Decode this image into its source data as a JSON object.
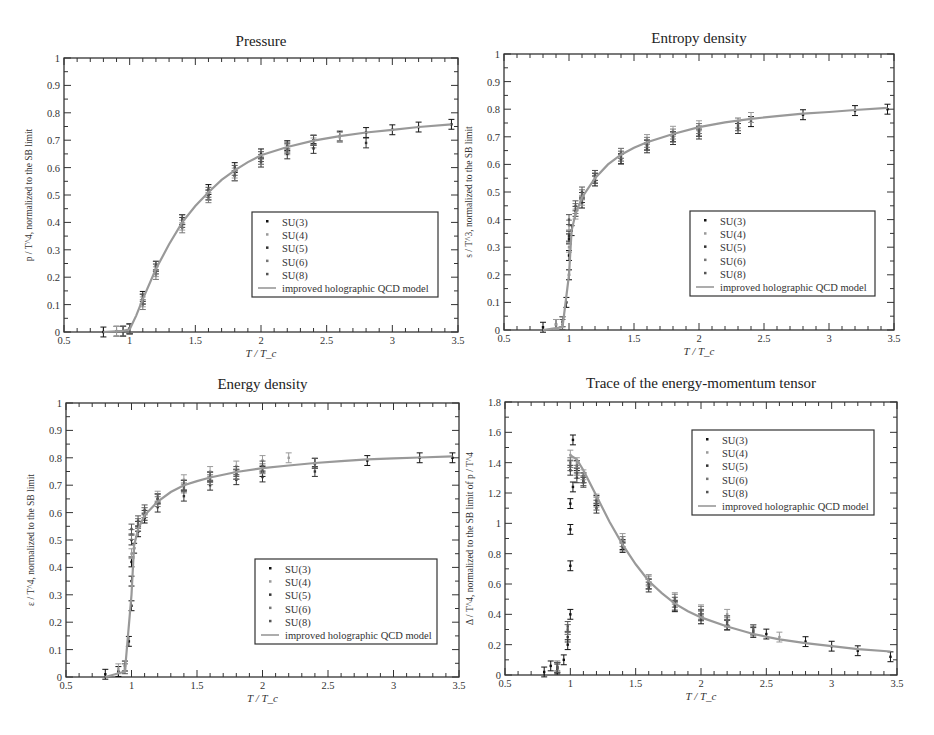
{
  "figure": {
    "background": "#ffffff",
    "legend_labels": [
      "SU(3)",
      "SU(4)",
      "SU(5)",
      "SU(6)",
      "SU(8)",
      "improved holographic QCD model"
    ],
    "series_colors": {
      "SU(3)": "#111111",
      "SU(4)": "#9a9a9a",
      "SU(5)": "#333333",
      "SU(6)": "#777777",
      "SU(8)": "#555555",
      "model": "#999999"
    }
  },
  "panels": [
    {
      "id": "pressure",
      "title": "Pressure",
      "xlabel": "T / T_c",
      "ylabel": "p / T^4, normalized to the SB limit",
      "xlim": [
        0.5,
        3.5
      ],
      "ylim": [
        0,
        1
      ],
      "xticks": [
        "0.5",
        "1",
        "1.5",
        "2",
        "2.5",
        "3",
        "3.5"
      ],
      "yticks": [
        "0",
        "0.1",
        "0.2",
        "0.3",
        "0.4",
        "0.5",
        "0.6",
        "0.7",
        "0.8",
        "0.9",
        "1"
      ],
      "legend_position": "lower right"
    },
    {
      "id": "entropy",
      "title": "Entropy density",
      "xlabel": "T / T_c",
      "ylabel": "s / T^3, normalized to the SB limit",
      "xlim": [
        0.5,
        3.5
      ],
      "ylim": [
        0,
        1
      ],
      "xticks": [
        "0.5",
        "1",
        "1.5",
        "2",
        "2.5",
        "3",
        "3.5"
      ],
      "yticks": [
        "0",
        "0.1",
        "0.2",
        "0.3",
        "0.4",
        "0.5",
        "0.6",
        "0.7",
        "0.8",
        "0.9",
        "1"
      ],
      "legend_position": "lower right"
    },
    {
      "id": "energy",
      "title": "Energy density",
      "xlabel": "T / T_c",
      "ylabel": "ε / T^4, normalized to the SB limit",
      "xlim": [
        0.5,
        3.5
      ],
      "ylim": [
        0,
        1
      ],
      "xticks": [
        "0.5",
        "1",
        "1.5",
        "2",
        "2.5",
        "3",
        "3.5"
      ],
      "yticks": [
        "0",
        "0.1",
        "0.2",
        "0.3",
        "0.4",
        "0.5",
        "0.6",
        "0.7",
        "0.8",
        "0.9",
        "1"
      ],
      "legend_position": "lower right"
    },
    {
      "id": "trace",
      "title": "Trace of the energy-momentum tensor",
      "xlabel": "T / T_c",
      "ylabel": "Δ / T^4, normalized to the SB limit of p / T^4",
      "xlim": [
        0.5,
        3.5
      ],
      "ylim": [
        0,
        1.8
      ],
      "xticks": [
        "0.5",
        "1",
        "1.5",
        "2",
        "2.5",
        "3",
        "3.5"
      ],
      "yticks": [
        "0",
        "0.2",
        "0.4",
        "0.6",
        "0.8",
        "1",
        "1.2",
        "1.4",
        "1.6",
        "1.8"
      ],
      "legend_position": "upper right"
    }
  ],
  "chart_data": [
    {
      "type": "scatter",
      "title": "Pressure",
      "xlabel": "T/T_c",
      "ylabel": "p/T^4, normalized to the SB limit",
      "xlim": [
        0.5,
        3.5
      ],
      "ylim": [
        0,
        1
      ],
      "grid": false,
      "legend": [
        "SU(3)",
        "SU(4)",
        "SU(5)",
        "SU(6)",
        "SU(8)",
        "improved holographic QCD model"
      ],
      "legend_position": "lower right",
      "model_curve": {
        "x": [
          0.8,
          0.95,
          1.0,
          1.05,
          1.1,
          1.2,
          1.3,
          1.4,
          1.5,
          1.6,
          1.7,
          1.8,
          1.9,
          2.0,
          2.2,
          2.4,
          2.6,
          2.8,
          3.0,
          3.2,
          3.45
        ],
        "y": [
          0.0,
          0.004,
          0.01,
          0.06,
          0.12,
          0.23,
          0.32,
          0.4,
          0.46,
          0.51,
          0.555,
          0.59,
          0.62,
          0.645,
          0.675,
          0.698,
          0.715,
          0.728,
          0.738,
          0.748,
          0.758
        ]
      },
      "series": [
        {
          "name": "SU(3)",
          "x": [
            0.8,
            0.9,
            1.0,
            1.1,
            1.2,
            1.4,
            1.6,
            1.8,
            2.0,
            2.2,
            2.4,
            2.6,
            2.8,
            3.0,
            3.2,
            3.45
          ],
          "y": [
            0.0,
            0.003,
            0.012,
            0.13,
            0.24,
            0.41,
            0.52,
            0.6,
            0.65,
            0.68,
            0.7,
            0.715,
            0.728,
            0.738,
            0.748,
            0.758
          ]
        },
        {
          "name": "SU(4)",
          "x": [
            0.9,
            1.0,
            1.1,
            1.2,
            1.4,
            1.6,
            1.8,
            2.0,
            2.2,
            2.4,
            2.6
          ],
          "y": [
            0.002,
            0.01,
            0.11,
            0.22,
            0.39,
            0.5,
            0.58,
            0.63,
            0.665,
            0.69,
            0.71
          ]
        },
        {
          "name": "SU(5)",
          "x": [
            0.95,
            1.0,
            1.1,
            1.2,
            1.4,
            1.6,
            1.8,
            2.0,
            2.2,
            2.4,
            2.8
          ],
          "y": [
            0.003,
            0.012,
            0.12,
            0.23,
            0.4,
            0.5,
            0.57,
            0.62,
            0.65,
            0.67,
            0.69
          ]
        },
        {
          "name": "SU(6)",
          "x": [
            0.95,
            1.0,
            1.1,
            1.2,
            1.4,
            1.6,
            1.8,
            2.0,
            2.2,
            2.4
          ],
          "y": [
            0.003,
            0.01,
            0.1,
            0.21,
            0.38,
            0.49,
            0.57,
            0.63,
            0.67,
            0.7
          ]
        },
        {
          "name": "SU(8)",
          "x": [
            0.95,
            1.0,
            1.1,
            1.2,
            1.4,
            1.6,
            1.8,
            2.0,
            2.2,
            2.4
          ],
          "y": [
            0.003,
            0.012,
            0.12,
            0.24,
            0.41,
            0.51,
            0.59,
            0.64,
            0.675,
            0.7
          ]
        }
      ]
    },
    {
      "type": "scatter",
      "title": "Entropy density",
      "xlabel": "T/T_c",
      "ylabel": "s/T^3, normalized to the SB limit",
      "xlim": [
        0.5,
        3.5
      ],
      "ylim": [
        0,
        1
      ],
      "grid": false,
      "legend": [
        "SU(3)",
        "SU(4)",
        "SU(5)",
        "SU(6)",
        "SU(8)",
        "improved holographic QCD model"
      ],
      "legend_position": "lower right",
      "model_curve": {
        "x": [
          0.8,
          0.95,
          1.0,
          1.02,
          1.05,
          1.1,
          1.2,
          1.3,
          1.4,
          1.5,
          1.6,
          1.8,
          2.0,
          2.2,
          2.4,
          2.6,
          2.8,
          3.0,
          3.2,
          3.45
        ],
        "y": [
          0.0,
          0.01,
          0.2,
          0.36,
          0.42,
          0.48,
          0.55,
          0.6,
          0.635,
          0.66,
          0.68,
          0.71,
          0.735,
          0.752,
          0.765,
          0.775,
          0.784,
          0.79,
          0.797,
          0.805
        ]
      },
      "series": [
        {
          "name": "SU(3)",
          "x": [
            0.8,
            0.9,
            0.98,
            1.0,
            1.0,
            1.0,
            1.02,
            1.1,
            1.2,
            1.4,
            1.6,
            1.8,
            2.0,
            2.4,
            2.8,
            3.2,
            3.45
          ],
          "y": [
            0.01,
            0.02,
            0.1,
            0.2,
            0.27,
            0.33,
            0.36,
            0.46,
            0.54,
            0.62,
            0.67,
            0.7,
            0.72,
            0.755,
            0.78,
            0.795,
            0.8
          ]
        },
        {
          "name": "SU(4)",
          "x": [
            0.9,
            1.0,
            1.05,
            1.1,
            1.2,
            1.4,
            1.6,
            1.8,
            2.0,
            2.4
          ],
          "y": [
            0.02,
            0.3,
            0.42,
            0.47,
            0.55,
            0.64,
            0.69,
            0.72,
            0.74,
            0.77
          ]
        },
        {
          "name": "SU(5)",
          "x": [
            0.95,
            1.0,
            1.05,
            1.1,
            1.2,
            1.4,
            1.6,
            1.8,
            2.0,
            2.3
          ],
          "y": [
            0.03,
            0.34,
            0.43,
            0.48,
            0.55,
            0.62,
            0.66,
            0.69,
            0.71,
            0.73
          ]
        },
        {
          "name": "SU(6)",
          "x": [
            0.95,
            1.0,
            1.05,
            1.1,
            1.2,
            1.4,
            1.6,
            1.8,
            2.0,
            2.3
          ],
          "y": [
            0.03,
            0.38,
            0.44,
            0.49,
            0.56,
            0.64,
            0.68,
            0.71,
            0.73,
            0.75
          ]
        },
        {
          "name": "SU(8)",
          "x": [
            0.95,
            1.0,
            1.05,
            1.1,
            1.2,
            1.4,
            1.6,
            1.8,
            2.0,
            2.3
          ],
          "y": [
            0.02,
            0.4,
            0.45,
            0.5,
            0.56,
            0.63,
            0.67,
            0.7,
            0.72,
            0.74
          ]
        }
      ]
    },
    {
      "type": "scatter",
      "title": "Energy density",
      "xlabel": "T/T_c",
      "ylabel": "ε/T^4, normalized to the SB limit",
      "xlim": [
        0.5,
        3.5
      ],
      "ylim": [
        0,
        1
      ],
      "grid": false,
      "legend": [
        "SU(3)",
        "SU(4)",
        "SU(5)",
        "SU(6)",
        "SU(8)",
        "improved holographic QCD model"
      ],
      "legend_position": "lower right",
      "model_curve": {
        "x": [
          0.8,
          0.95,
          1.0,
          1.02,
          1.05,
          1.1,
          1.2,
          1.3,
          1.4,
          1.5,
          1.6,
          1.8,
          2.0,
          2.2,
          2.4,
          2.6,
          2.8,
          3.0,
          3.2,
          3.45
        ],
        "y": [
          0.0,
          0.02,
          0.3,
          0.48,
          0.54,
          0.59,
          0.64,
          0.675,
          0.7,
          0.715,
          0.728,
          0.748,
          0.762,
          0.772,
          0.781,
          0.788,
          0.794,
          0.798,
          0.801,
          0.805
        ]
      },
      "series": [
        {
          "name": "SU(3)",
          "x": [
            0.8,
            0.9,
            0.98,
            1.0,
            1.0,
            1.0,
            1.02,
            1.05,
            1.1,
            1.2,
            1.4,
            1.6,
            1.8,
            2.0,
            2.4,
            2.8,
            3.2,
            3.45
          ],
          "y": [
            0.01,
            0.02,
            0.13,
            0.26,
            0.35,
            0.42,
            0.47,
            0.53,
            0.58,
            0.65,
            0.7,
            0.73,
            0.74,
            0.75,
            0.78,
            0.79,
            0.8,
            0.8
          ]
        },
        {
          "name": "SU(4)",
          "x": [
            0.9,
            1.0,
            1.05,
            1.1,
            1.2,
            1.4,
            1.6,
            1.8,
            2.0,
            2.2
          ],
          "y": [
            0.03,
            0.45,
            0.55,
            0.6,
            0.66,
            0.72,
            0.75,
            0.77,
            0.79,
            0.8
          ]
        },
        {
          "name": "SU(5)",
          "x": [
            0.95,
            1.0,
            1.05,
            1.1,
            1.2,
            1.4,
            1.6,
            1.8,
            2.0,
            2.4
          ],
          "y": [
            0.04,
            0.5,
            0.55,
            0.59,
            0.62,
            0.66,
            0.7,
            0.72,
            0.73,
            0.75
          ]
        },
        {
          "name": "SU(6)",
          "x": [
            0.95,
            1.0,
            1.05,
            1.1,
            1.2,
            1.4,
            1.6,
            1.8,
            2.0,
            2.4
          ],
          "y": [
            0.04,
            0.52,
            0.56,
            0.6,
            0.64,
            0.69,
            0.72,
            0.74,
            0.76,
            0.78
          ]
        },
        {
          "name": "SU(8)",
          "x": [
            0.95,
            1.0,
            1.05,
            1.1,
            1.2,
            1.4,
            1.6,
            1.8,
            2.0,
            2.4
          ],
          "y": [
            0.03,
            0.54,
            0.57,
            0.61,
            0.65,
            0.7,
            0.73,
            0.75,
            0.77,
            0.78
          ]
        }
      ]
    },
    {
      "type": "scatter",
      "title": "Trace of the energy-momentum tensor",
      "xlabel": "T/T_c",
      "ylabel": "Δ/T^4, normalized to the SB limit of p/T^4",
      "xlim": [
        0.5,
        3.5
      ],
      "ylim": [
        0,
        1.8
      ],
      "grid": false,
      "legend": [
        "SU(3)",
        "SU(4)",
        "SU(5)",
        "SU(6)",
        "SU(8)",
        "improved holographic QCD model"
      ],
      "legend_position": "upper right",
      "model_curve": {
        "x": [
          1.0,
          1.05,
          1.1,
          1.2,
          1.3,
          1.4,
          1.5,
          1.6,
          1.7,
          1.8,
          1.9,
          2.0,
          2.2,
          2.4,
          2.6,
          2.8,
          3.0,
          3.2,
          3.45
        ],
        "y": [
          1.45,
          1.42,
          1.35,
          1.18,
          1.01,
          0.86,
          0.73,
          0.62,
          0.54,
          0.47,
          0.42,
          0.38,
          0.32,
          0.27,
          0.235,
          0.21,
          0.19,
          0.17,
          0.155
        ]
      },
      "series": [
        {
          "name": "SU(3)",
          "x": [
            0.8,
            0.85,
            0.9,
            0.95,
            0.98,
            1.0,
            1.0,
            1.0,
            1.0,
            1.02,
            1.02,
            1.05,
            1.1,
            1.2,
            1.4,
            1.6,
            1.8,
            2.0,
            2.2,
            2.5,
            2.8,
            3.0,
            3.2,
            3.45
          ],
          "y": [
            0.02,
            0.06,
            0.04,
            0.1,
            0.2,
            0.4,
            0.72,
            0.96,
            1.13,
            1.24,
            1.55,
            1.38,
            1.3,
            1.15,
            0.86,
            0.6,
            0.45,
            0.37,
            0.33,
            0.27,
            0.22,
            0.19,
            0.16,
            0.12
          ]
        },
        {
          "name": "SU(4)",
          "x": [
            0.9,
            0.98,
            1.0,
            1.05,
            1.1,
            1.2,
            1.4,
            1.6,
            1.8,
            2.0,
            2.2,
            2.4,
            2.6
          ],
          "y": [
            0.05,
            0.3,
            1.45,
            1.4,
            1.32,
            1.16,
            0.9,
            0.63,
            0.51,
            0.43,
            0.4,
            0.3,
            0.25
          ]
        },
        {
          "name": "SU(5)",
          "x": [
            0.9,
            0.98,
            1.0,
            1.05,
            1.1,
            1.2,
            1.4,
            1.6,
            1.8,
            2.0,
            2.2,
            2.4
          ],
          "y": [
            0.05,
            0.25,
            1.35,
            1.3,
            1.28,
            1.1,
            0.84,
            0.58,
            0.46,
            0.39,
            0.33,
            0.28
          ]
        },
        {
          "name": "SU(6)",
          "x": [
            0.9,
            0.98,
            1.0,
            1.05,
            1.1,
            1.2,
            1.4,
            1.6,
            1.8,
            2.0,
            2.2,
            2.4
          ],
          "y": [
            0.06,
            0.3,
            1.4,
            1.35,
            1.3,
            1.14,
            0.88,
            0.62,
            0.5,
            0.42,
            0.36,
            0.3
          ]
        },
        {
          "name": "SU(8)",
          "x": [
            0.9,
            0.98,
            1.0,
            1.05,
            1.1,
            1.2,
            1.4,
            1.6,
            1.8,
            2.0,
            2.2,
            2.4
          ],
          "y": [
            0.05,
            0.32,
            1.38,
            1.33,
            1.27,
            1.12,
            0.85,
            0.6,
            0.48,
            0.4,
            0.35,
            0.29
          ]
        }
      ]
    }
  ]
}
